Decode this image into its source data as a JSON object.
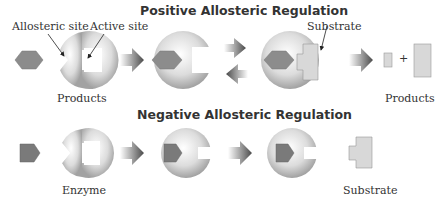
{
  "positive": {
    "title": "Positive Allosteric Regulation",
    "labels": {
      "allosteric_site": "Allosteric site",
      "active_site": "Active site",
      "substrate": "Substrate",
      "products_left": "Products",
      "products_right": "Products",
      "plus": "+"
    }
  },
  "negative": {
    "title": "Negative Allosteric Regulation",
    "labels": {
      "enzyme": "Enzyme",
      "substrate": "Substrate"
    }
  },
  "colors": {
    "activator": "#8a8a8a",
    "inhibitor": "#7a7a7a",
    "substrate": "#d8d8d8",
    "enzyme_light": "#f4f4f4",
    "enzyme_dark": "#a0a0a0",
    "arrow": "#555555"
  }
}
